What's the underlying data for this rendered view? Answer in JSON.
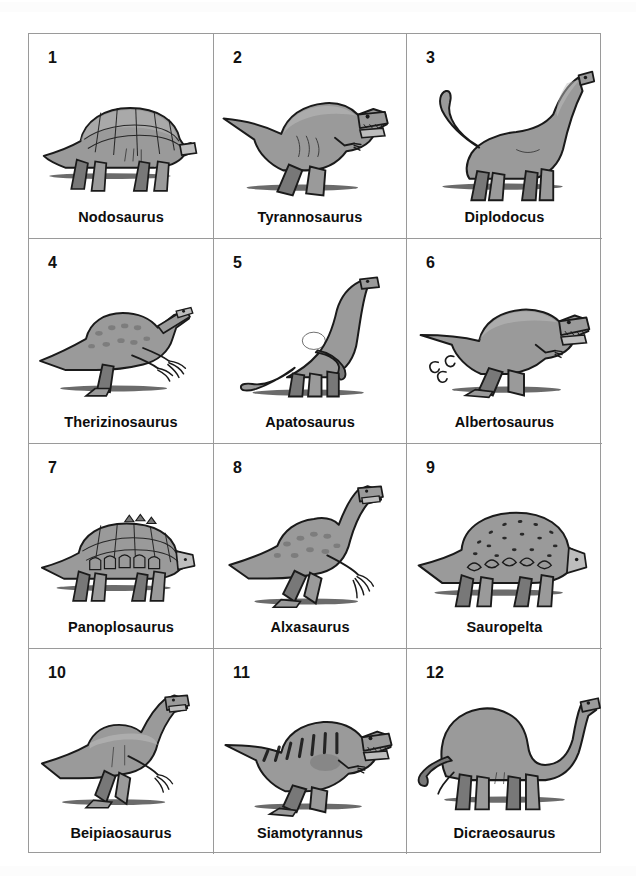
{
  "page": {
    "columns": 3,
    "rows": 4,
    "total_items": 12,
    "colors": {
      "background": "#ffffff",
      "grid_line": "#9a9a9a",
      "label_text": "#0d0d0d",
      "number_text": "#111111",
      "body_fill": "#9a9a9a",
      "body_shade": "#787878",
      "body_highlight": "#bdbdbd",
      "outline": "#1a1a1a",
      "ground_shadow": "#3a3a3a"
    }
  },
  "items": [
    {
      "number": "1",
      "name": "Nodosaurus",
      "icon": "nodosaurus-illustration",
      "group": "armoured",
      "posture": "quadruped"
    },
    {
      "number": "2",
      "name": "Tyrannosaurus",
      "icon": "tyrannosaurus-illustration",
      "group": "theropod",
      "posture": "biped"
    },
    {
      "number": "3",
      "name": "Diplodocus",
      "icon": "diplodocus-illustration",
      "group": "sauropod",
      "posture": "quadruped"
    },
    {
      "number": "4",
      "name": "Therizinosaurus",
      "icon": "therizinosaurus-illustration",
      "group": "theropod",
      "posture": "biped"
    },
    {
      "number": "5",
      "name": "Apatosaurus",
      "icon": "apatosaurus-illustration",
      "group": "sauropod",
      "posture": "quadruped"
    },
    {
      "number": "6",
      "name": "Albertosaurus",
      "icon": "albertosaurus-illustration",
      "group": "theropod",
      "posture": "biped"
    },
    {
      "number": "7",
      "name": "Panoplosaurus",
      "icon": "panoplosaurus-illustration",
      "group": "armoured",
      "posture": "quadruped"
    },
    {
      "number": "8",
      "name": "Alxasaurus",
      "icon": "alxasaurus-illustration",
      "group": "theropod",
      "posture": "biped"
    },
    {
      "number": "9",
      "name": "Sauropelta",
      "icon": "sauropelta-illustration",
      "group": "armoured",
      "posture": "quadruped"
    },
    {
      "number": "10",
      "name": "Beipiaosaurus",
      "icon": "beipiaosaurus-illustration",
      "group": "theropod",
      "posture": "biped"
    },
    {
      "number": "11",
      "name": "Siamotyrannus",
      "icon": "siamotyrannus-illustration",
      "group": "theropod",
      "posture": "biped"
    },
    {
      "number": "12",
      "name": "Dicraeosaurus",
      "icon": "dicraeosaurus-illustration",
      "group": "sauropod",
      "posture": "quadruped"
    }
  ]
}
